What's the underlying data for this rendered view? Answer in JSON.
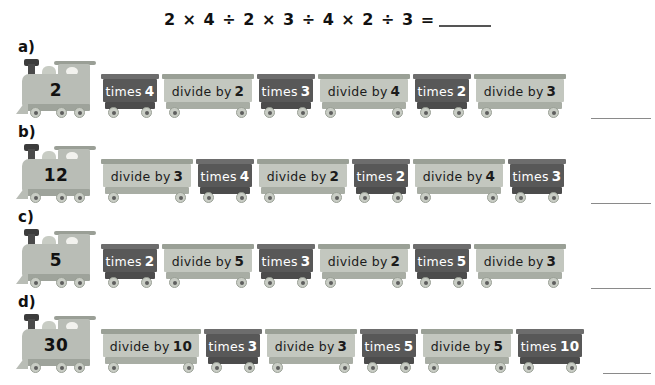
{
  "page": {
    "clipped_header": "",
    "equation": {
      "text": "2 × 4 ÷ 2 × 3 ÷ 4 × 2 ÷ 3 =",
      "answer_blank": ""
    }
  },
  "rows": [
    {
      "label": "a)",
      "start_number": "2",
      "carriages": [
        {
          "op": "times",
          "verb": "times",
          "value": "4"
        },
        {
          "op": "divide",
          "verb": "divide by",
          "value": "2"
        },
        {
          "op": "times",
          "verb": "times",
          "value": "3"
        },
        {
          "op": "divide",
          "verb": "divide by",
          "value": "4"
        },
        {
          "op": "times",
          "verb": "times",
          "value": "2"
        },
        {
          "op": "divide",
          "verb": "divide by",
          "value": "3"
        }
      ]
    },
    {
      "label": "b)",
      "start_number": "12",
      "carriages": [
        {
          "op": "divide",
          "verb": "divide by",
          "value": "3"
        },
        {
          "op": "times",
          "verb": "times",
          "value": "4"
        },
        {
          "op": "divide",
          "verb": "divide by",
          "value": "2"
        },
        {
          "op": "times",
          "verb": "times",
          "value": "2"
        },
        {
          "op": "divide",
          "verb": "divide by",
          "value": "4"
        },
        {
          "op": "times",
          "verb": "times",
          "value": "3"
        }
      ]
    },
    {
      "label": "c)",
      "start_number": "5",
      "carriages": [
        {
          "op": "times",
          "verb": "times",
          "value": "2"
        },
        {
          "op": "divide",
          "verb": "divide by",
          "value": "5"
        },
        {
          "op": "times",
          "verb": "times",
          "value": "3"
        },
        {
          "op": "divide",
          "verb": "divide by",
          "value": "2"
        },
        {
          "op": "times",
          "verb": "times",
          "value": "5"
        },
        {
          "op": "divide",
          "verb": "divide by",
          "value": "3"
        }
      ]
    },
    {
      "label": "d)",
      "start_number": "30",
      "carriages": [
        {
          "op": "divide",
          "verb": "divide by",
          "value": "10"
        },
        {
          "op": "times",
          "verb": "times",
          "value": "3"
        },
        {
          "op": "divide",
          "verb": "divide by",
          "value": "3"
        },
        {
          "op": "times",
          "verb": "times",
          "value": "5"
        },
        {
          "op": "divide",
          "verb": "divide by",
          "value": "5"
        },
        {
          "op": "times",
          "verb": "times",
          "value": "10"
        }
      ]
    }
  ],
  "colors": {
    "carriage_dark": "#585858",
    "carriage_light": "#c3c7bf",
    "locomotive": "#b9bdb6",
    "text_dark": "#111111",
    "text_light": "#ffffff"
  }
}
